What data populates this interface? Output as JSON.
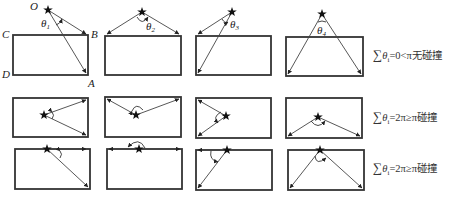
{
  "figure": {
    "point_labels": {
      "O": "O",
      "A": "A",
      "B": "B",
      "C": "C",
      "D": "D"
    },
    "theta_labels": [
      "θ",
      "θ",
      "θ",
      "θ"
    ],
    "theta_subscripts": [
      "1",
      "2",
      "3",
      "4"
    ],
    "rows": [
      {
        "condition": {
          "sum_symbol": "∑",
          "var": "θ",
          "sub": "i",
          "rest": "=0<π无碰撞"
        }
      },
      {
        "condition": {
          "sum_symbol": "∑",
          "var": "θ",
          "sub": "i",
          "rest": "=2π≥π碰撞"
        }
      },
      {
        "condition": {
          "sum_symbol": "∑",
          "var": "θ",
          "sub": "i",
          "rest": "=2π≥π碰撞"
        }
      }
    ],
    "colors": {
      "stroke": "#333333",
      "star": "#111111",
      "background": "#ffffff"
    }
  }
}
